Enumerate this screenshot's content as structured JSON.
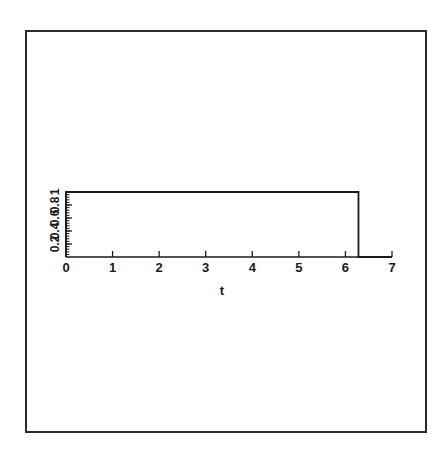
{
  "figure": {
    "background_color": "#ffffff",
    "frame_color": "#2b2b2b",
    "line_color": "#1a1a1a"
  },
  "chart_data": {
    "type": "line",
    "title": "",
    "subtitle": "",
    "xlabel": "t",
    "ylabel": "",
    "xlim": [
      0,
      7
    ],
    "ylim": [
      0,
      1.05
    ],
    "grid": false,
    "legend": null,
    "x_ticks": [
      0,
      1,
      2,
      3,
      4,
      5,
      6,
      7
    ],
    "x_tick_labels": [
      "0",
      "1",
      "2",
      "3",
      "4",
      "5",
      "6",
      "7"
    ],
    "y_ticks": [
      0.2,
      0.4,
      0.6,
      0.8,
      1
    ],
    "y_tick_labels": [
      "0.2",
      "0.4",
      "0.6",
      "0.8",
      "1"
    ],
    "y_tick_label_rotation": 90,
    "series": [
      {
        "name": "rectangular pulse",
        "x": [
          0,
          0,
          6.28,
          6.28,
          7
        ],
        "y": [
          0,
          1,
          1,
          0,
          0
        ]
      }
    ],
    "annotations": []
  },
  "axes": {
    "x_axis_name": "horizontal-axis",
    "y_axis_name": "vertical-axis",
    "x_label_text": "t"
  }
}
